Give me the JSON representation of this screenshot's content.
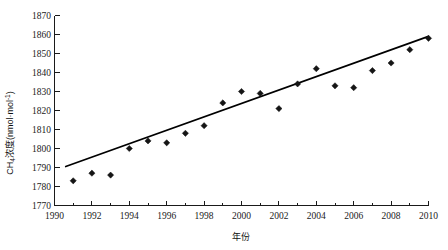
{
  "chart_data": {
    "type": "scatter",
    "title": "",
    "subtitle": "",
    "xlabel": "年份",
    "ylabel": "CH4浓度(nmol·mol-1)",
    "ylabel_parts": {
      "prefix": "CH",
      "subscript": "4",
      "middle": "浓度(nmol·mol",
      "superscript": "-1",
      "suffix": ")"
    },
    "xlim": [
      1990,
      2010
    ],
    "ylim": [
      1770,
      1870
    ],
    "grid": false,
    "legend": null,
    "x_ticks": [
      1990,
      1992,
      1994,
      1996,
      1998,
      2000,
      2002,
      2004,
      2006,
      2008,
      2010
    ],
    "x_tick_labels": [
      "1990",
      "1992",
      "1994",
      "1996",
      "1998",
      "2000",
      "2002",
      "2004",
      "2006",
      "2008",
      "2010"
    ],
    "x_minor_ticks": [
      1991,
      1993,
      1995,
      1997,
      1999,
      2001,
      2003,
      2005,
      2007,
      2009
    ],
    "y_ticks": [
      1770,
      1780,
      1790,
      1800,
      1810,
      1820,
      1830,
      1840,
      1850,
      1860,
      1870
    ],
    "y_tick_labels": [
      "1770",
      "1780",
      "1790",
      "1800",
      "1810",
      "1820",
      "1830",
      "1840",
      "1850",
      "1860",
      "1870"
    ],
    "marker_shape": "diamond",
    "marker_color": "#151515",
    "series": [
      {
        "name": "CH4 concentration",
        "x": [
          1991,
          1992,
          1993,
          1994,
          1995,
          1996,
          1997,
          1998,
          1999,
          2000,
          2001,
          2002,
          2003,
          2004,
          2005,
          2006,
          2007,
          2008,
          2009,
          2010
        ],
        "values": [
          1783,
          1787,
          1786,
          1800,
          1804,
          1803,
          1808,
          1812,
          1824,
          1830,
          1829,
          1821,
          1834,
          1842,
          1833,
          1832,
          1841,
          1845,
          1852,
          1858
        ]
      }
    ],
    "trend_line": {
      "type": "linear",
      "x_start": 1990.6,
      "y_start": 1790.5,
      "x_end": 2010.0,
      "y_end": 1859.0,
      "color": "#000000"
    }
  }
}
